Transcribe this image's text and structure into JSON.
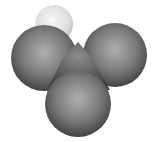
{
  "figure": {
    "type": "space-filling molecular model",
    "background": "#ffffff",
    "atoms": [
      {
        "name": "hydrogen",
        "cx": 54,
        "cy": 24,
        "r": 19,
        "color_light": "#f4f4f4",
        "color_dark": "#bdbdbd"
      },
      {
        "name": "chlorine-right",
        "cx": 115,
        "cy": 55,
        "r": 32,
        "color_light": "#a8a8a8",
        "color_dark": "#3c3c3c"
      },
      {
        "name": "chlorine-left",
        "cx": 44,
        "cy": 58,
        "r": 33,
        "color_light": "#a8a8a8",
        "color_dark": "#3c3c3c"
      },
      {
        "name": "carbon-center",
        "cx": 80,
        "cy": 68,
        "r": 22,
        "color_light": "#8a8a8a",
        "color_dark": "#3a3a3a"
      },
      {
        "name": "chlorine-bottom",
        "cx": 78,
        "cy": 104,
        "r": 33,
        "color_light": "#a8a8a8",
        "color_dark": "#3c3c3c"
      }
    ]
  }
}
